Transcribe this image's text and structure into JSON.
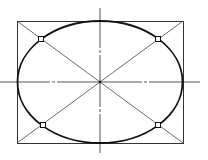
{
  "diagram": {
    "type": "ellipse-in-rectangle-construction",
    "canvas": {
      "width": 208,
      "height": 160,
      "background": "#ffffff"
    },
    "colors": {
      "ellipse": "#111111",
      "rectangle": "#333333",
      "diagonal": "#444444",
      "centerline": "#555555",
      "marker": "#111111"
    },
    "rectangle": {
      "x1": 17,
      "y1": 21,
      "x2": 183,
      "y2": 143
    },
    "center": {
      "x": 100,
      "y": 82
    },
    "ellipse": {
      "cx": 100,
      "cy": 82,
      "rx": 82.5,
      "ry": 61
    },
    "centerlines": {
      "horizontal": {
        "y": 82,
        "segments": [
          [
            0,
            50
          ],
          [
            52,
            55
          ],
          [
            57,
            142
          ],
          [
            144,
            147
          ],
          [
            149,
            200
          ]
        ]
      },
      "vertical": {
        "x": 100,
        "segments": [
          [
            8,
            48
          ],
          [
            50,
            53
          ],
          [
            55,
            107
          ],
          [
            109,
            112
          ],
          [
            114,
            153
          ]
        ]
      }
    },
    "diagonals": [
      {
        "x1": 17,
        "y1": 21,
        "x2": 183,
        "y2": 143
      },
      {
        "x1": 183,
        "y1": 21,
        "x2": 17,
        "y2": 143
      }
    ],
    "markers": [
      {
        "name": "top-left",
        "x": 41,
        "y": 39
      },
      {
        "name": "top-right",
        "x": 158,
        "y": 39
      },
      {
        "name": "bottom-left",
        "x": 43,
        "y": 125
      },
      {
        "name": "bottom-right",
        "x": 158,
        "y": 125
      }
    ]
  }
}
